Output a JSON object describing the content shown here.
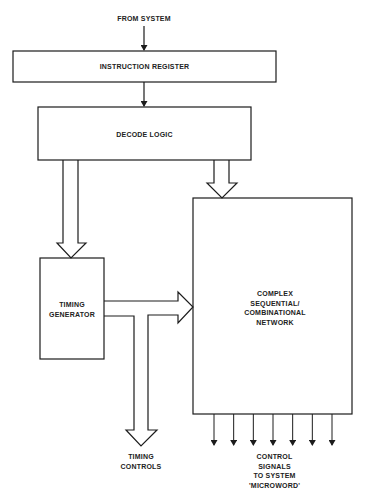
{
  "colors": {
    "stroke": "#1c1c1c",
    "background": "#ffffff",
    "text": "#222222"
  },
  "labels": {
    "from_system": "FROM SYSTEM",
    "instruction_register": "INSTRUCTION REGISTER",
    "decode_logic": "DECODE LOGIC",
    "timing_generator": "TIMING\nGENERATOR",
    "complex_network": "COMPLEX\nSEQUENTIAL/\nCOMBINATIONAL\nNETWORK",
    "timing_controls": "TIMING\nCONTROLS",
    "control_signals": "CONTROL\nSIGNALS\nTO SYSTEM\n'MICROWORD'"
  },
  "control_signal_count": 7
}
